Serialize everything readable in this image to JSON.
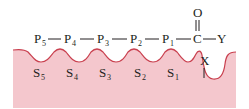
{
  "diagram": {
    "type": "enzyme-substrate-subsite-binding",
    "colors": {
      "enzyme_fill": "#f4c7cd",
      "enzyme_outline": "#c9404f",
      "text": "#231f20",
      "background": "#ffffff"
    },
    "residues": [
      {
        "base": "P",
        "sub": "5"
      },
      {
        "base": "P",
        "sub": "4"
      },
      {
        "base": "P",
        "sub": "3"
      },
      {
        "base": "P",
        "sub": "2"
      },
      {
        "base": "P",
        "sub": "1"
      }
    ],
    "carbonyl": {
      "carbon": "C",
      "oxygen": "O",
      "leaving_group": "Y"
    },
    "subsites": [
      {
        "base": "S",
        "sub": "5"
      },
      {
        "base": "S",
        "sub": "4"
      },
      {
        "base": "S",
        "sub": "3"
      },
      {
        "base": "S",
        "sub": "2"
      },
      {
        "base": "S",
        "sub": "1"
      }
    ],
    "catalytic_group": "X"
  }
}
